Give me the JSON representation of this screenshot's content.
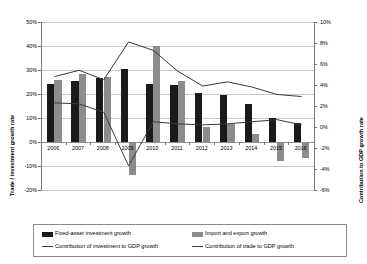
{
  "chart_data": {
    "type": "bar",
    "title": "",
    "subtitle": "",
    "categories": [
      "2006",
      "2007",
      "2008",
      "2009",
      "2010",
      "2011",
      "2012",
      "2013",
      "2014",
      "2015",
      "2016"
    ],
    "xlabel": "",
    "ylabel": "Trade / investment growth rate",
    "ylabel_secondary": "Contribution to GDP growth rate",
    "ylim": [
      -20,
      50
    ],
    "ylim_secondary": [
      -6,
      10
    ],
    "yticks": [
      "50%",
      "40%",
      "30%",
      "20%",
      "10%",
      "0%",
      "-10%",
      "-20%"
    ],
    "ytick_values": [
      50,
      40,
      30,
      20,
      10,
      0,
      -10,
      -20
    ],
    "yticks_secondary": [
      "10%",
      "8%",
      "6%",
      "4%",
      "2%",
      "0%",
      "-2%",
      "-4%",
      "-6%"
    ],
    "ytick_values_secondary": [
      10,
      8,
      6,
      4,
      2,
      0,
      -2,
      -4,
      -6
    ],
    "grid": true,
    "legend_position": "bottom",
    "series": [
      {
        "name": "Fixed-asset investment growth",
        "type": "bar",
        "axis": "left",
        "color": "#1a1a1a",
        "values": [
          24.0,
          25.5,
          26.5,
          30.5,
          24.0,
          23.8,
          20.5,
          19.6,
          15.7,
          10.0,
          8.1
        ]
      },
      {
        "name": "Import and export growth",
        "type": "bar",
        "axis": "left",
        "color": "#8c8c8c",
        "values": [
          26.0,
          28.5,
          27.0,
          -13.9,
          39.8,
          25.4,
          6.2,
          7.6,
          3.4,
          -8.0,
          -6.8
        ]
      },
      {
        "name": "Contribution of investment to GDP growth",
        "type": "line",
        "axis": "right",
        "color": "#3a3a3a",
        "values": [
          4.8,
          5.4,
          4.5,
          8.1,
          7.3,
          5.3,
          3.9,
          4.3,
          3.8,
          3.1,
          2.9
        ]
      },
      {
        "name": "Contribution of trade to GDP growth",
        "type": "line",
        "axis": "right",
        "color": "#3a3a3a",
        "values": [
          2.3,
          2.2,
          1.4,
          -3.7,
          0.5,
          0.3,
          0.2,
          0.3,
          0.5,
          0.7,
          0.2
        ]
      }
    ],
    "legend": [
      "Fixed-asset investment growth",
      "Import and export growth",
      "Contribution of investment to GDP growth",
      "Contribution of trade to GDP growth"
    ]
  }
}
